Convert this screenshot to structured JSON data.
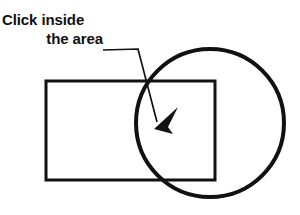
{
  "canvas": {
    "width": 300,
    "height": 215,
    "background": "#ffffff",
    "stroke_color": "#111111"
  },
  "instruction": {
    "line1": "Click inside",
    "line2": "the area",
    "align_line1": "left",
    "align_line2": "right",
    "font_weight": "bold",
    "font_size_px": 15,
    "color": "#111111"
  },
  "shapes": {
    "rectangle": {
      "name": "rectangle",
      "x": 46,
      "y": 81,
      "width": 169,
      "height": 99,
      "stroke_width": 3,
      "fill": "none",
      "stroke": "#111111"
    },
    "circle": {
      "name": "circle",
      "cx": 210,
      "cy": 123,
      "r": 74,
      "stroke_width": 4,
      "fill": "none",
      "stroke": "#111111"
    }
  },
  "annotation": {
    "leader_line": {
      "name": "leader-line",
      "points": "103,50 138,49 157,122",
      "stroke_width": 1.6,
      "stroke": "#111111"
    },
    "arrowhead": {
      "name": "arrowhead",
      "tip_x": 155,
      "tip_y": 128,
      "points": "155,128 176,108 167,126 172,133",
      "fill": "#111111"
    },
    "target_region": "overlap of rectangle and circle"
  }
}
